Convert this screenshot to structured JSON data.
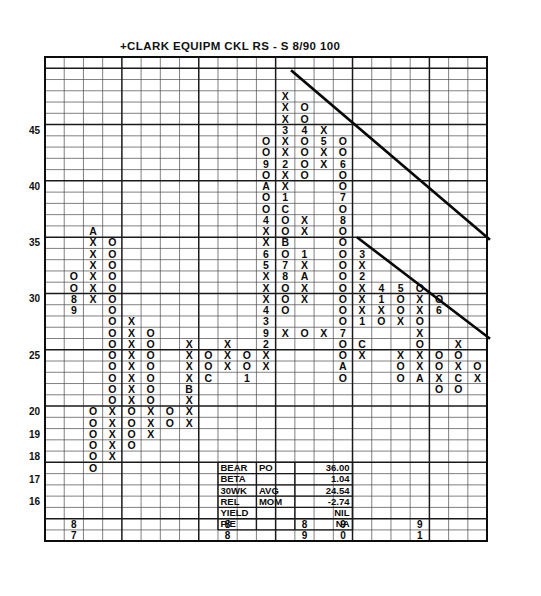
{
  "chart_data": {
    "type": "table",
    "title": "+CLARK  EQUIPM  CKL      RS - S  8/90  100",
    "subtitle": "",
    "xlabel": "",
    "ylabel": "",
    "grid": true,
    "legend_position": "none",
    "notation": "Point & Figure chart: X = rising column, O = falling column, digits/letters = month codes (1-9, A=Oct, B=Nov, C=Dec)",
    "ylim": [
      15,
      48
    ],
    "y_tick_labels": [
      "45",
      "40",
      "35",
      "30",
      "25",
      "20",
      "19",
      "18",
      "17",
      "16"
    ],
    "y_tick_values": [
      45,
      40,
      35,
      30,
      25,
      20,
      19,
      18,
      17,
      16
    ],
    "x_tick_labels": [
      "87",
      "88",
      "89",
      "90",
      "91"
    ],
    "grid_columns": 23,
    "grid_rows": 43,
    "marks": [
      {
        "col": 12,
        "row": 3,
        "text": "X"
      },
      {
        "col": 12,
        "row": 4,
        "text": "X"
      },
      {
        "col": 13,
        "row": 4,
        "text": "O"
      },
      {
        "col": 12,
        "row": 5,
        "text": "X"
      },
      {
        "col": 13,
        "row": 5,
        "text": "O"
      },
      {
        "col": 12,
        "row": 6,
        "text": "3"
      },
      {
        "col": 13,
        "row": 6,
        "text": "4"
      },
      {
        "col": 14,
        "row": 6,
        "text": "X"
      },
      {
        "col": 11,
        "row": 7,
        "text": "O"
      },
      {
        "col": 12,
        "row": 7,
        "text": "X"
      },
      {
        "col": 13,
        "row": 7,
        "text": "O"
      },
      {
        "col": 14,
        "row": 7,
        "text": "5"
      },
      {
        "col": 15,
        "row": 7,
        "text": "O"
      },
      {
        "col": 11,
        "row": 8,
        "text": "O"
      },
      {
        "col": 12,
        "row": 8,
        "text": "X"
      },
      {
        "col": 13,
        "row": 8,
        "text": "O"
      },
      {
        "col": 14,
        "row": 8,
        "text": "X"
      },
      {
        "col": 15,
        "row": 8,
        "text": "O"
      },
      {
        "col": 11,
        "row": 9,
        "text": "9"
      },
      {
        "col": 12,
        "row": 9,
        "text": "2"
      },
      {
        "col": 13,
        "row": 9,
        "text": "O"
      },
      {
        "col": 14,
        "row": 9,
        "text": "X"
      },
      {
        "col": 15,
        "row": 9,
        "text": "6"
      },
      {
        "col": 11,
        "row": 10,
        "text": "O"
      },
      {
        "col": 12,
        "row": 10,
        "text": "X"
      },
      {
        "col": 13,
        "row": 10,
        "text": "O"
      },
      {
        "col": 15,
        "row": 10,
        "text": "O"
      },
      {
        "col": 11,
        "row": 11,
        "text": "A"
      },
      {
        "col": 12,
        "row": 11,
        "text": "X"
      },
      {
        "col": 15,
        "row": 11,
        "text": "O"
      },
      {
        "col": 11,
        "row": 12,
        "text": "O"
      },
      {
        "col": 12,
        "row": 12,
        "text": "1"
      },
      {
        "col": 15,
        "row": 12,
        "text": "7"
      },
      {
        "col": 11,
        "row": 13,
        "text": "O"
      },
      {
        "col": 12,
        "row": 13,
        "text": "C"
      },
      {
        "col": 15,
        "row": 13,
        "text": "O"
      },
      {
        "col": 11,
        "row": 14,
        "text": "4"
      },
      {
        "col": 12,
        "row": 14,
        "text": "O"
      },
      {
        "col": 13,
        "row": 14,
        "text": "X"
      },
      {
        "col": 15,
        "row": 14,
        "text": "8"
      },
      {
        "col": 2,
        "row": 15,
        "text": "A"
      },
      {
        "col": 11,
        "row": 15,
        "text": "X"
      },
      {
        "col": 12,
        "row": 15,
        "text": "O"
      },
      {
        "col": 13,
        "row": 15,
        "text": "X"
      },
      {
        "col": 15,
        "row": 15,
        "text": "O"
      },
      {
        "col": 2,
        "row": 16,
        "text": "X"
      },
      {
        "col": 3,
        "row": 16,
        "text": "O"
      },
      {
        "col": 11,
        "row": 16,
        "text": "X"
      },
      {
        "col": 12,
        "row": 16,
        "text": "B"
      },
      {
        "col": 15,
        "row": 16,
        "text": "O"
      },
      {
        "col": 2,
        "row": 17,
        "text": "X"
      },
      {
        "col": 3,
        "row": 17,
        "text": "O"
      },
      {
        "col": 11,
        "row": 17,
        "text": "6"
      },
      {
        "col": 12,
        "row": 17,
        "text": "O"
      },
      {
        "col": 13,
        "row": 17,
        "text": "1"
      },
      {
        "col": 15,
        "row": 17,
        "text": "O"
      },
      {
        "col": 16,
        "row": 17,
        "text": "3"
      },
      {
        "col": 2,
        "row": 18,
        "text": "X"
      },
      {
        "col": 3,
        "row": 18,
        "text": "O"
      },
      {
        "col": 11,
        "row": 18,
        "text": "5"
      },
      {
        "col": 12,
        "row": 18,
        "text": "7"
      },
      {
        "col": 13,
        "row": 18,
        "text": "X"
      },
      {
        "col": 15,
        "row": 18,
        "text": "O"
      },
      {
        "col": 16,
        "row": 18,
        "text": "X"
      },
      {
        "col": 1,
        "row": 19,
        "text": "O"
      },
      {
        "col": 2,
        "row": 19,
        "text": "X"
      },
      {
        "col": 3,
        "row": 19,
        "text": "O"
      },
      {
        "col": 11,
        "row": 19,
        "text": "X"
      },
      {
        "col": 12,
        "row": 19,
        "text": "8"
      },
      {
        "col": 13,
        "row": 19,
        "text": "A"
      },
      {
        "col": 15,
        "row": 19,
        "text": "O"
      },
      {
        "col": 16,
        "row": 19,
        "text": "2"
      },
      {
        "col": 1,
        "row": 20,
        "text": "O"
      },
      {
        "col": 2,
        "row": 20,
        "text": "X"
      },
      {
        "col": 3,
        "row": 20,
        "text": "O"
      },
      {
        "col": 11,
        "row": 20,
        "text": "X"
      },
      {
        "col": 12,
        "row": 20,
        "text": "O"
      },
      {
        "col": 13,
        "row": 20,
        "text": "X"
      },
      {
        "col": 15,
        "row": 20,
        "text": "O"
      },
      {
        "col": 16,
        "row": 20,
        "text": "X"
      },
      {
        "col": 17,
        "row": 20,
        "text": "4"
      },
      {
        "col": 18,
        "row": 20,
        "text": "5"
      },
      {
        "col": 19,
        "row": 20,
        "text": "O"
      },
      {
        "col": 1,
        "row": 21,
        "text": "8"
      },
      {
        "col": 2,
        "row": 21,
        "text": "X"
      },
      {
        "col": 3,
        "row": 21,
        "text": "O"
      },
      {
        "col": 11,
        "row": 21,
        "text": "X"
      },
      {
        "col": 12,
        "row": 21,
        "text": "O"
      },
      {
        "col": 13,
        "row": 21,
        "text": "X"
      },
      {
        "col": 15,
        "row": 21,
        "text": "O"
      },
      {
        "col": 16,
        "row": 21,
        "text": "X"
      },
      {
        "col": 17,
        "row": 21,
        "text": "1"
      },
      {
        "col": 18,
        "row": 21,
        "text": "O"
      },
      {
        "col": 19,
        "row": 21,
        "text": "X"
      },
      {
        "col": 20,
        "row": 21,
        "text": "O"
      },
      {
        "col": 1,
        "row": 22,
        "text": "9"
      },
      {
        "col": 3,
        "row": 22,
        "text": "O"
      },
      {
        "col": 11,
        "row": 22,
        "text": "4"
      },
      {
        "col": 12,
        "row": 22,
        "text": "O"
      },
      {
        "col": 15,
        "row": 22,
        "text": "O"
      },
      {
        "col": 16,
        "row": 22,
        "text": "X"
      },
      {
        "col": 17,
        "row": 22,
        "text": "X"
      },
      {
        "col": 18,
        "row": 22,
        "text": "O"
      },
      {
        "col": 19,
        "row": 22,
        "text": "X"
      },
      {
        "col": 20,
        "row": 22,
        "text": "6"
      },
      {
        "col": 3,
        "row": 23,
        "text": "O"
      },
      {
        "col": 4,
        "row": 23,
        "text": "X"
      },
      {
        "col": 11,
        "row": 23,
        "text": "3"
      },
      {
        "col": 15,
        "row": 23,
        "text": "O"
      },
      {
        "col": 16,
        "row": 23,
        "text": "1"
      },
      {
        "col": 17,
        "row": 23,
        "text": "O"
      },
      {
        "col": 18,
        "row": 23,
        "text": "X"
      },
      {
        "col": 19,
        "row": 23,
        "text": "O"
      },
      {
        "col": 3,
        "row": 24,
        "text": "O"
      },
      {
        "col": 4,
        "row": 24,
        "text": "X"
      },
      {
        "col": 5,
        "row": 24,
        "text": "O"
      },
      {
        "col": 11,
        "row": 24,
        "text": "9"
      },
      {
        "col": 12,
        "row": 24,
        "text": "X"
      },
      {
        "col": 13,
        "row": 24,
        "text": "O"
      },
      {
        "col": 14,
        "row": 24,
        "text": "X"
      },
      {
        "col": 15,
        "row": 24,
        "text": "7"
      },
      {
        "col": 19,
        "row": 24,
        "text": "X"
      },
      {
        "col": 3,
        "row": 25,
        "text": "O"
      },
      {
        "col": 4,
        "row": 25,
        "text": "X"
      },
      {
        "col": 5,
        "row": 25,
        "text": "O"
      },
      {
        "col": 7,
        "row": 25,
        "text": "X"
      },
      {
        "col": 9,
        "row": 25,
        "text": "X"
      },
      {
        "col": 11,
        "row": 25,
        "text": "2"
      },
      {
        "col": 15,
        "row": 25,
        "text": "O"
      },
      {
        "col": 16,
        "row": 25,
        "text": "C"
      },
      {
        "col": 19,
        "row": 25,
        "text": "O"
      },
      {
        "col": 21,
        "row": 25,
        "text": "X"
      },
      {
        "col": 3,
        "row": 26,
        "text": "O"
      },
      {
        "col": 4,
        "row": 26,
        "text": "X"
      },
      {
        "col": 5,
        "row": 26,
        "text": "O"
      },
      {
        "col": 7,
        "row": 26,
        "text": "X"
      },
      {
        "col": 8,
        "row": 26,
        "text": "O"
      },
      {
        "col": 9,
        "row": 26,
        "text": "X"
      },
      {
        "col": 10,
        "row": 26,
        "text": "O"
      },
      {
        "col": 11,
        "row": 26,
        "text": "X"
      },
      {
        "col": 15,
        "row": 26,
        "text": "O"
      },
      {
        "col": 16,
        "row": 26,
        "text": "X"
      },
      {
        "col": 18,
        "row": 26,
        "text": "X"
      },
      {
        "col": 19,
        "row": 26,
        "text": "X"
      },
      {
        "col": 20,
        "row": 26,
        "text": "O"
      },
      {
        "col": 21,
        "row": 26,
        "text": "O"
      },
      {
        "col": 3,
        "row": 27,
        "text": "O"
      },
      {
        "col": 4,
        "row": 27,
        "text": "X"
      },
      {
        "col": 5,
        "row": 27,
        "text": "O"
      },
      {
        "col": 7,
        "row": 27,
        "text": "X"
      },
      {
        "col": 8,
        "row": 27,
        "text": "O"
      },
      {
        "col": 9,
        "row": 27,
        "text": "X"
      },
      {
        "col": 10,
        "row": 27,
        "text": "O"
      },
      {
        "col": 11,
        "row": 27,
        "text": "X"
      },
      {
        "col": 15,
        "row": 27,
        "text": "A"
      },
      {
        "col": 18,
        "row": 27,
        "text": "O"
      },
      {
        "col": 19,
        "row": 27,
        "text": "X"
      },
      {
        "col": 20,
        "row": 27,
        "text": "O"
      },
      {
        "col": 21,
        "row": 27,
        "text": "X"
      },
      {
        "col": 22,
        "row": 27,
        "text": "O"
      },
      {
        "col": 3,
        "row": 28,
        "text": "O"
      },
      {
        "col": 4,
        "row": 28,
        "text": "X"
      },
      {
        "col": 5,
        "row": 28,
        "text": "O"
      },
      {
        "col": 7,
        "row": 28,
        "text": "X"
      },
      {
        "col": 8,
        "row": 28,
        "text": "C"
      },
      {
        "col": 10,
        "row": 28,
        "text": "1"
      },
      {
        "col": 15,
        "row": 28,
        "text": "O"
      },
      {
        "col": 18,
        "row": 28,
        "text": "O"
      },
      {
        "col": 19,
        "row": 28,
        "text": "A"
      },
      {
        "col": 20,
        "row": 28,
        "text": "X"
      },
      {
        "col": 21,
        "row": 28,
        "text": "C"
      },
      {
        "col": 22,
        "row": 28,
        "text": "X"
      },
      {
        "col": 3,
        "row": 29,
        "text": "O"
      },
      {
        "col": 4,
        "row": 29,
        "text": "X"
      },
      {
        "col": 5,
        "row": 29,
        "text": "O"
      },
      {
        "col": 7,
        "row": 29,
        "text": "B"
      },
      {
        "col": 20,
        "row": 29,
        "text": "O"
      },
      {
        "col": 21,
        "row": 29,
        "text": "O"
      },
      {
        "col": 3,
        "row": 30,
        "text": "O"
      },
      {
        "col": 4,
        "row": 30,
        "text": "X"
      },
      {
        "col": 5,
        "row": 30,
        "text": "O"
      },
      {
        "col": 7,
        "row": 30,
        "text": "X"
      },
      {
        "col": 2,
        "row": 31,
        "text": "O"
      },
      {
        "col": 3,
        "row": 31,
        "text": "X"
      },
      {
        "col": 4,
        "row": 31,
        "text": "O"
      },
      {
        "col": 5,
        "row": 31,
        "text": "X"
      },
      {
        "col": 6,
        "row": 31,
        "text": "O"
      },
      {
        "col": 7,
        "row": 31,
        "text": "X"
      },
      {
        "col": 2,
        "row": 32,
        "text": "O"
      },
      {
        "col": 3,
        "row": 32,
        "text": "X"
      },
      {
        "col": 4,
        "row": 32,
        "text": "O"
      },
      {
        "col": 5,
        "row": 32,
        "text": "X"
      },
      {
        "col": 6,
        "row": 32,
        "text": "O"
      },
      {
        "col": 7,
        "row": 32,
        "text": "X"
      },
      {
        "col": 2,
        "row": 33,
        "text": "O"
      },
      {
        "col": 3,
        "row": 33,
        "text": "X"
      },
      {
        "col": 4,
        "row": 33,
        "text": "O"
      },
      {
        "col": 5,
        "row": 33,
        "text": "X"
      },
      {
        "col": 2,
        "row": 34,
        "text": "O"
      },
      {
        "col": 3,
        "row": 34,
        "text": "X"
      },
      {
        "col": 4,
        "row": 34,
        "text": "O"
      },
      {
        "col": 2,
        "row": 35,
        "text": "O"
      },
      {
        "col": 3,
        "row": 35,
        "text": "X"
      },
      {
        "col": 2,
        "row": 36,
        "text": "O"
      }
    ],
    "trendlines": [
      {
        "name": "bearish-resistance-upper",
        "x1": 292,
        "y1": 71,
        "x2": 489,
        "y2": 239
      },
      {
        "name": "bearish-resistance-lower",
        "x1": 358,
        "y1": 238,
        "x2": 489,
        "y2": 338
      }
    ]
  },
  "title": {
    "text": "+CLARK   EQUIPM   CKL        RS - S   8/90   100",
    "symbol": "CKL",
    "company": "CLARK EQUIPM",
    "relative_strength": "RS - S",
    "date": "8/90",
    "scale": "100"
  },
  "info_table": {
    "rows": [
      {
        "label": "BEAR",
        "mid": "PO",
        "value": "36.00"
      },
      {
        "label": "BETA",
        "mid": "",
        "value": "1.04"
      },
      {
        "label": "30WK",
        "mid": "AVG",
        "value": "24.54"
      },
      {
        "label": "REL",
        "mid": "MOM",
        "value": "-2.74"
      },
      {
        "label": "YIELD",
        "mid": "",
        "value": "NIL"
      },
      {
        "label": "P/E",
        "mid": "",
        "value": "NA"
      }
    ]
  },
  "year_axis": {
    "years": [
      {
        "top": "8",
        "bottom": "7",
        "col": 1
      },
      {
        "top": "8",
        "bottom": "8",
        "col": 9
      },
      {
        "top": "8",
        "bottom": "9",
        "col": 13
      },
      {
        "top": "9",
        "bottom": "0",
        "col": 15
      },
      {
        "top": "9",
        "bottom": "1",
        "col": 19
      }
    ]
  },
  "y_axis": {
    "ticks": [
      {
        "label": "45",
        "row": 6
      },
      {
        "label": "40",
        "row": 11
      },
      {
        "label": "35",
        "row": 16
      },
      {
        "label": "30",
        "row": 21
      },
      {
        "label": "25",
        "row": 26
      },
      {
        "label": "20",
        "row": 31
      },
      {
        "label": "19",
        "row": 33
      },
      {
        "label": "18",
        "row": 35
      },
      {
        "label": "17",
        "row": 37
      },
      {
        "label": "16",
        "row": 39
      }
    ]
  },
  "colors": {
    "ink": "#0b0b0b",
    "grid_minor": "#4a4a4a",
    "grid_major": "#1a1a1a",
    "paper": "#ffffff"
  }
}
